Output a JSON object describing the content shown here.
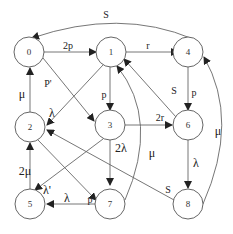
{
  "diagram": {
    "type": "state-transition",
    "nodes": [
      {
        "id": "0",
        "label": "0"
      },
      {
        "id": "1",
        "label": "1"
      },
      {
        "id": "2",
        "label": "2"
      },
      {
        "id": "3",
        "label": "3"
      },
      {
        "id": "4",
        "label": "4"
      },
      {
        "id": "5",
        "label": "5"
      },
      {
        "id": "6",
        "label": "6"
      },
      {
        "id": "7",
        "label": "7"
      },
      {
        "id": "8",
        "label": "8"
      }
    ],
    "edges": [
      {
        "from": "0",
        "to": "1",
        "label": "2p"
      },
      {
        "from": "0",
        "to": "3",
        "label": "P'"
      },
      {
        "from": "1",
        "to": "4",
        "label": "r"
      },
      {
        "from": "1",
        "to": "3",
        "label": "p"
      },
      {
        "from": "1",
        "to": "2",
        "label": "λ"
      },
      {
        "from": "4",
        "to": "0",
        "label": "S"
      },
      {
        "from": "4",
        "to": "6",
        "label": "p"
      },
      {
        "from": "6",
        "to": "1",
        "label": "S"
      },
      {
        "from": "3",
        "to": "6",
        "label": "2r"
      },
      {
        "from": "3",
        "to": "7",
        "label": "2λ"
      },
      {
        "from": "3",
        "to": "5",
        "label": "λ'"
      },
      {
        "from": "6",
        "to": "8",
        "label": "λ"
      },
      {
        "from": "8",
        "to": "4",
        "label": "μ"
      },
      {
        "from": "7",
        "to": "1",
        "label": "μ"
      },
      {
        "from": "8",
        "to": "2",
        "label": "S"
      },
      {
        "from": "2",
        "to": "0",
        "label": "μ"
      },
      {
        "from": "5",
        "to": "2",
        "label": "2μ"
      },
      {
        "from": "2",
        "to": "7",
        "label": "p"
      },
      {
        "from": "7",
        "to": "5",
        "label": "λ"
      }
    ]
  }
}
